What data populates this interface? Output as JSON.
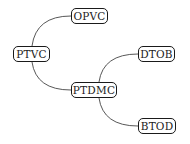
{
  "diagram": {
    "type": "tree",
    "nodes": [
      {
        "id": "ptvc",
        "label": "PTVC",
        "x": 13,
        "y": 46,
        "w": 37
      },
      {
        "id": "opvc",
        "label": "OPVC",
        "x": 71,
        "y": 8,
        "w": 37
      },
      {
        "id": "ptdmc",
        "label": "PTDMC",
        "x": 71,
        "y": 82,
        "w": 46
      },
      {
        "id": "dtob",
        "label": "DTOB",
        "x": 138,
        "y": 46,
        "w": 37
      },
      {
        "id": "btod",
        "label": "BTOD",
        "x": 138,
        "y": 118,
        "w": 38
      }
    ],
    "edges": [
      {
        "from": "ptvc",
        "to": "opvc"
      },
      {
        "from": "ptvc",
        "to": "ptdmc"
      },
      {
        "from": "ptdmc",
        "to": "dtob"
      },
      {
        "from": "ptdmc",
        "to": "btod"
      }
    ]
  }
}
